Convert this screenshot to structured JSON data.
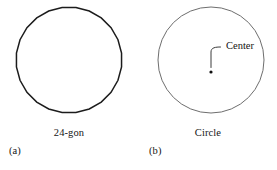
{
  "figure": {
    "background_color": "#ffffff",
    "panels": [
      {
        "id": "a",
        "letter": "(a)",
        "name": "24-gon",
        "shape": "polygon",
        "sides": 24,
        "stroke_color": "#1c1c1c",
        "stroke_width": 1.5,
        "center_x": 69,
        "center_y": 60,
        "radius": 53,
        "annotation": null
      },
      {
        "id": "b",
        "letter": "(b)",
        "name": "Circle",
        "shape": "circle",
        "stroke_color": "#6e6e6e",
        "stroke_width": 1.0,
        "center_x": 72,
        "center_y": 60,
        "radius": 53,
        "annotation": {
          "label": "Center",
          "label_x": 83,
          "label_y": 45,
          "dot_x": 72,
          "dot_y": 72,
          "dot_color": "#101010",
          "leader_color": "#3a3a3a"
        }
      }
    ]
  }
}
